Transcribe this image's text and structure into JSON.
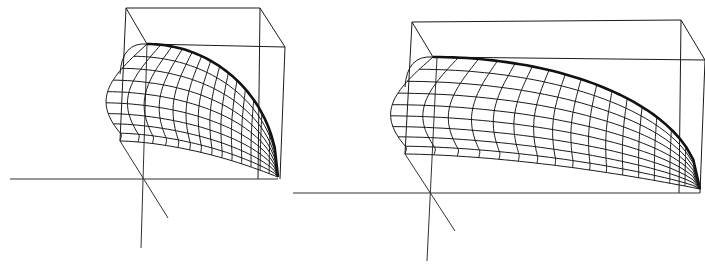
{
  "figure": {
    "colors": {
      "line": "#1a1a1a",
      "background": "#ffffff"
    },
    "panels": [
      {
        "id": "left",
        "type": "3d-wireframe-surface",
        "mesh_columns": 14,
        "mesh_rows": 9,
        "box": {
          "back_tl": [
            126,
            8
          ],
          "back_tr": [
            260,
            8
          ],
          "front_tl": [
            147,
            44
          ],
          "front_tr": [
            285,
            47
          ],
          "front_bl": [
            120,
            141
          ],
          "base_br": [
            278,
            179
          ]
        },
        "axes": {
          "horizontal_y": 179,
          "horizontal_x": [
            10,
            278
          ],
          "vertical_top": [
            147,
            44
          ],
          "vertical_bottom": [
            141,
            248
          ],
          "depth_end": [
            168,
            218
          ]
        }
      },
      {
        "id": "right",
        "type": "3d-wireframe-surface",
        "mesh_columns": 16,
        "mesh_rows": 9,
        "box": {
          "back_tl": [
            412,
            22
          ],
          "back_tr": [
            681,
            20
          ],
          "front_tl": [
            433,
            57
          ],
          "front_tr": [
            705,
            60
          ],
          "front_bl": [
            405,
            154
          ],
          "base_br": [
            700,
            191
          ]
        },
        "axes": {
          "horizontal_y": 193,
          "horizontal_x": [
            293,
            700
          ],
          "vertical_top": [
            437,
            57
          ],
          "vertical_bottom": [
            427,
            261
          ],
          "depth_end": [
            455,
            231
          ]
        }
      }
    ]
  }
}
